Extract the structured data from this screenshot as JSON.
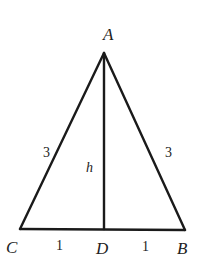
{
  "figure": {
    "type": "isosceles-triangle-with-altitude",
    "stroke_color": "#1a1a1a",
    "vertices": {
      "A": {
        "label": "A",
        "x": 104,
        "y": 53
      },
      "B": {
        "label": "B",
        "x": 185,
        "y": 230
      },
      "C": {
        "label": "C",
        "x": 20,
        "y": 229
      },
      "D": {
        "label": "D",
        "x": 104,
        "y": 229
      }
    },
    "segment_labels": {
      "AC": "3",
      "AB": "3",
      "AD": "h",
      "CD": "1",
      "DB": "1"
    }
  }
}
